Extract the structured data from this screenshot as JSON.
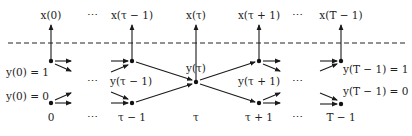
{
  "diagram": {
    "type": "time-unrolled trellis / state transition diagram",
    "separator": {
      "style": "dashed",
      "y": 43
    },
    "time_steps": [
      {
        "id": "t0",
        "x": 51,
        "bottom_label": "0",
        "top_label": "x(0)"
      },
      {
        "id": "tm1",
        "x": 132,
        "bottom_label": "τ − 1",
        "top_label": "x(τ − 1)"
      },
      {
        "id": "t",
        "x": 196,
        "bottom_label": "τ",
        "top_label": "x(τ)"
      },
      {
        "id": "tp1",
        "x": 259,
        "bottom_label": "τ + 1",
        "top_label": "x(τ + 1)"
      },
      {
        "id": "tT",
        "x": 341,
        "bottom_label": "T − 1",
        "top_label": "x(T − 1)"
      }
    ],
    "ellipsis": "⋯",
    "top_ellipses_x": [
      92,
      297
    ],
    "bottom_ellipses_x": [
      92,
      297
    ],
    "middle_ellipses_x": [
      92,
      297
    ],
    "state_labels": {
      "y0_1": "y(0) = 1",
      "y0_0": "y(0) = 0",
      "y_tm1": "y(τ − 1)",
      "y_t": "y(τ)",
      "y_tp1": "y(τ + 1)",
      "yT_1": "y(T − 1) = 1",
      "yT_0": "y(T − 1) = 0"
    },
    "nodes": [
      {
        "id": "n0_top",
        "x": 51,
        "y": 61
      },
      {
        "id": "n0_bot",
        "x": 51,
        "y": 103
      },
      {
        "id": "nm1_top",
        "x": 132,
        "y": 61
      },
      {
        "id": "nm1_bot",
        "x": 132,
        "y": 103
      },
      {
        "id": "nt",
        "x": 196,
        "y": 82
      },
      {
        "id": "np1_top",
        "x": 259,
        "y": 61
      },
      {
        "id": "np1_bot",
        "x": 259,
        "y": 103
      },
      {
        "id": "nT_top",
        "x": 341,
        "y": 61
      },
      {
        "id": "nT_bot",
        "x": 341,
        "y": 104
      }
    ],
    "edges": [
      {
        "from": "nm1_top",
        "to": "nt"
      },
      {
        "from": "nm1_bot",
        "to": "nt"
      },
      {
        "from": "nt",
        "to": "np1_top"
      },
      {
        "from": "nt",
        "to": "np1_bot"
      }
    ],
    "colors": {
      "ink": "#1a1a1a",
      "background": "#ffffff"
    }
  }
}
